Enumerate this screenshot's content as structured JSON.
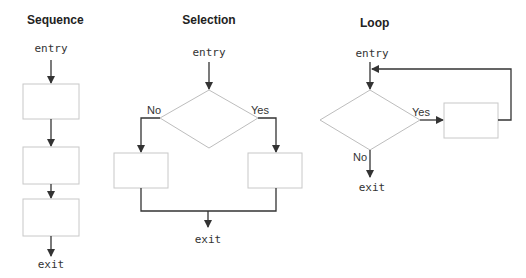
{
  "colors": {
    "line": "#333333",
    "shape_stroke": "#c8c8c8",
    "background": "#ffffff"
  },
  "sequence": {
    "title": "Sequence",
    "entry": "entry",
    "exit": "exit",
    "boxes": 3
  },
  "selection": {
    "title": "Selection",
    "entry": "entry",
    "exit": "exit",
    "no_label": "No",
    "yes_label": "Yes"
  },
  "loop": {
    "title": "Loop",
    "entry": "entry",
    "exit": "exit",
    "no_label": "No",
    "yes_label": "Yes"
  }
}
